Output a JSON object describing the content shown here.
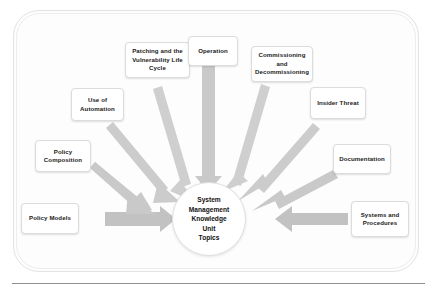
{
  "diagram": {
    "title": "System Management Knowledge Unit Topics",
    "hub": {
      "lines": [
        "System",
        "Management",
        "Knowledge",
        "Unit",
        "Topics"
      ]
    },
    "colors": {
      "arrow_fill": "#c9c9c9",
      "arrow_fill_light": "#d8d8d8",
      "box_background": "#ffffff",
      "box_border": "#dcdcdd",
      "text": "#1a1a1a",
      "frame_border": "#e3e3e5",
      "rule": "#8d8f93"
    },
    "nodes": [
      {
        "id": "patching",
        "label": "Patching and the Vulnerability Life Cycle"
      },
      {
        "id": "operation",
        "label": "Operation"
      },
      {
        "id": "commissioning",
        "label": "Commissioning and Decommissioning"
      },
      {
        "id": "use-of-automation",
        "label": "Use of Automation"
      },
      {
        "id": "insider-threat",
        "label": "Insider Threat"
      },
      {
        "id": "policy-composition",
        "label": "Policy Composition"
      },
      {
        "id": "documentation",
        "label": "Documentation"
      },
      {
        "id": "policy-models",
        "label": "Policy Models"
      },
      {
        "id": "systems-and-procedures",
        "label": "Systems and Procedures"
      }
    ]
  }
}
